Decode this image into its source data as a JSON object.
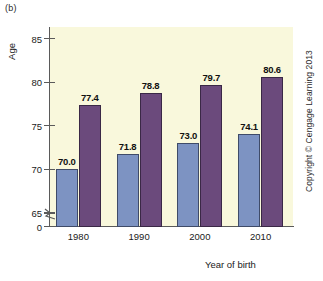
{
  "figure": {
    "panel_label": "(b)",
    "credit": "Copyright © Cengage Learning 2013"
  },
  "chart_data": {
    "type": "bar",
    "title": "",
    "subtitle": "",
    "xlabel": "Year of birth",
    "ylabel": "Age",
    "categories": [
      "1980",
      "1990",
      "2000",
      "2010"
    ],
    "series": [
      {
        "name": "series-1",
        "color": "#7d93c2",
        "values": [
          70.0,
          71.8,
          73.0,
          74.1
        ],
        "labels": [
          "70.0",
          "71.8",
          "73.0",
          "74.1"
        ]
      },
      {
        "name": "series-2",
        "color": "#6b4a7c",
        "values": [
          77.4,
          78.8,
          79.7,
          80.6
        ],
        "labels": [
          "77.4",
          "78.8",
          "79.7",
          "80.6"
        ]
      }
    ],
    "ylim": [
      65,
      86
    ],
    "yticks": [
      65,
      70,
      75,
      80,
      85
    ],
    "ytick_labels": [
      "65",
      "70",
      "75",
      "80",
      "85"
    ],
    "y_origin_label": "0",
    "y_axis_break": true,
    "grid": false,
    "legend": "none",
    "plot_background": "#f9f8dc"
  }
}
